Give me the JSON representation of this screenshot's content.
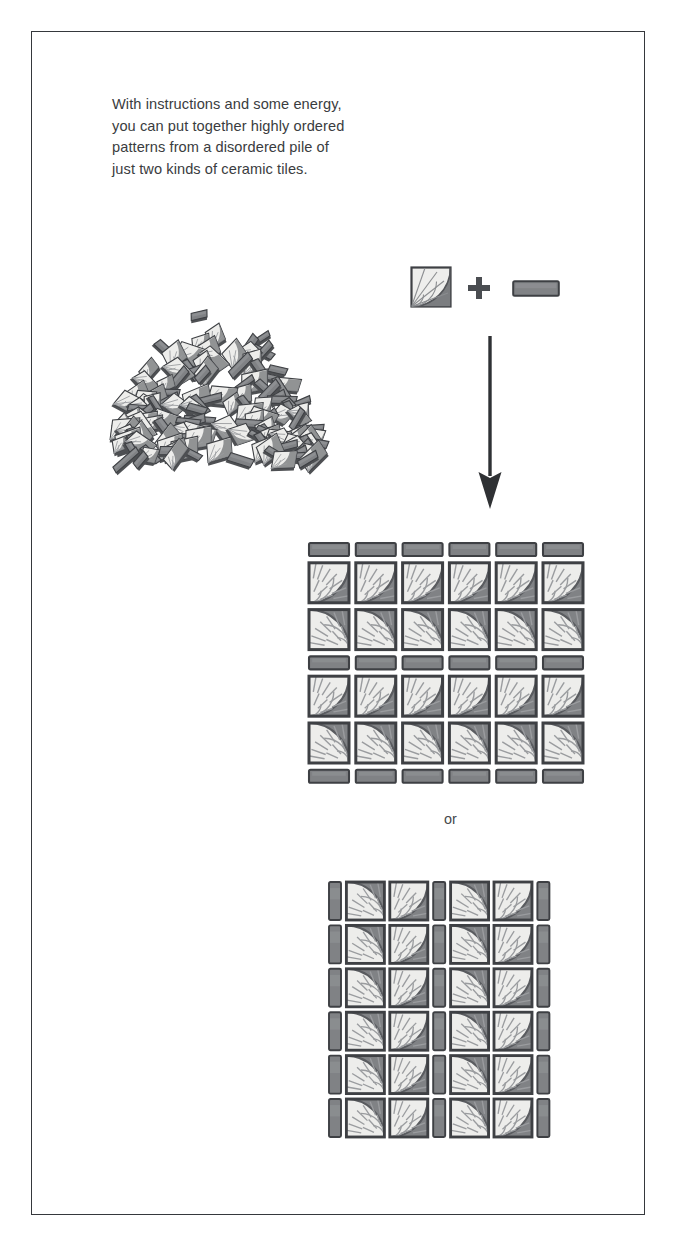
{
  "page": {
    "background_color": "#ffffff",
    "frame": {
      "name": "illustration-border",
      "color": "#35383c"
    }
  },
  "caption": {
    "text": "With instructions and some energy,\nyou can put together highly ordered\npatterns from a disordered pile of\njust two kinds of ceramic tiles.",
    "color": "#3a3c40"
  },
  "legend": {
    "square_tile": {
      "name": "square-fan-tile",
      "description": "square ceramic tile with quarter-circle fan pattern",
      "fill": "#eeeeec",
      "dark_corner": "#7b7d80",
      "outline": "#3e4044"
    },
    "plus_sign": {
      "glyph": "+",
      "color": "#4a4d51"
    },
    "rect_tile": {
      "name": "rectangular-tile",
      "description": "plain rectangular ceramic tile",
      "fill": "#818386",
      "outline": "#3e4044"
    }
  },
  "arrow": {
    "name": "downward-arrow",
    "direction": "down",
    "color": "#2f3134"
  },
  "pile": {
    "name": "disordered-tile-pile",
    "description": "a jumbled heap of square and rectangular ceramic tiles"
  },
  "connector": {
    "or_label": "or"
  },
  "patterns": [
    {
      "id": "pattern-a",
      "name": "ordered-pattern-grid-a",
      "layout": "horizontal-banded",
      "columns": 6,
      "square_rows": 4,
      "rect_rows": 3,
      "description": "rows of rectangular tiles alternating with rows of square fan tiles forming horizontal bands"
    },
    {
      "id": "pattern-b",
      "name": "ordered-pattern-grid-b",
      "layout": "vertical-banded",
      "rows": 6,
      "square_columns": 4,
      "rect_columns": 3,
      "description": "columns of rectangular tiles alternating with pairs of square fan tiles forming half-circle motifs"
    }
  ],
  "colors": {
    "tile_light": "#ededeb",
    "tile_mid": "#b9bbbd",
    "tile_dark": "#808285",
    "tile_outline": "#3e4044",
    "ink": "#3a3c40"
  }
}
